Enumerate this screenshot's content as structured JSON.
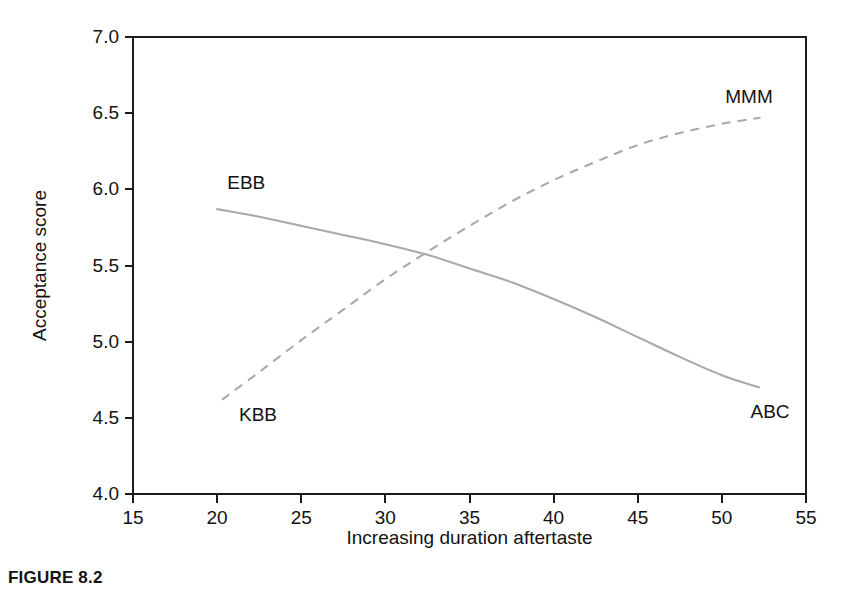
{
  "figure": {
    "caption": "FIGURE 8.2"
  },
  "chart_data": {
    "type": "line",
    "title": "",
    "xlabel": "Increasing duration aftertaste",
    "ylabel": "Acceptance score",
    "xlim": [
      15,
      55
    ],
    "ylim": [
      4.0,
      7.0
    ],
    "xticks": [
      15,
      20,
      25,
      30,
      35,
      40,
      45,
      50,
      55
    ],
    "xtick_labels": [
      "15",
      "20",
      "25",
      "30",
      "35",
      "40",
      "45",
      "50",
      "55"
    ],
    "yticks": [
      4.0,
      4.5,
      5.0,
      5.5,
      6.0,
      6.5,
      7.0
    ],
    "ytick_labels": [
      "4.0",
      "4.5",
      "5.0",
      "5.5",
      "6.0",
      "6.5",
      "7.0"
    ],
    "grid": false,
    "legend": "none (inline end labels)",
    "line_color": "#a9a9a9",
    "series": [
      {
        "name": "EBB-ABC",
        "style": "solid",
        "color": "#a9a9a9",
        "start_label": "EBB",
        "end_label": "ABC",
        "x": [
          20.0,
          22.5,
          25.0,
          27.5,
          30.0,
          32.5,
          35.0,
          37.5,
          40.0,
          42.5,
          45.0,
          47.5,
          50.0,
          52.2
        ],
        "y": [
          5.87,
          5.82,
          5.76,
          5.7,
          5.64,
          5.57,
          5.48,
          5.39,
          5.28,
          5.16,
          5.03,
          4.9,
          4.78,
          4.7
        ]
      },
      {
        "name": "KBB-MMM",
        "style": "dashed",
        "color": "#a9a9a9",
        "start_label": "KBB",
        "end_label": "MMM",
        "x": [
          20.3,
          22.5,
          25.0,
          27.5,
          30.0,
          32.5,
          35.0,
          37.5,
          40.0,
          42.5,
          45.0,
          47.5,
          50.0,
          52.3
        ],
        "y": [
          4.62,
          4.8,
          5.01,
          5.21,
          5.41,
          5.59,
          5.76,
          5.92,
          6.06,
          6.18,
          6.29,
          6.37,
          6.43,
          6.47
        ]
      }
    ],
    "annotations": [
      {
        "text": "EBB",
        "x": 20.6,
        "y": 6.0
      },
      {
        "text": "MMM",
        "x": 50.2,
        "y": 6.57
      },
      {
        "text": "KBB",
        "x": 21.3,
        "y": 4.48
      },
      {
        "text": "ABC",
        "x": 51.7,
        "y": 4.5
      }
    ],
    "crossover": {
      "x": 31.9,
      "y": 5.58
    }
  }
}
